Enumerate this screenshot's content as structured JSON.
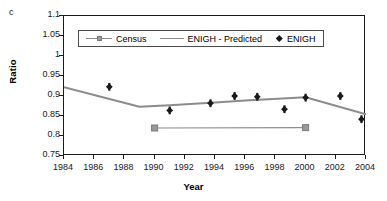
{
  "panel": {
    "letter": "c"
  },
  "chart_data": {
    "type": "line",
    "title": "",
    "xlabel": "Year",
    "ylabel": "Ratio",
    "xlim": [
      1984,
      2004
    ],
    "ylim": [
      0.75,
      1.1
    ],
    "xticks": [
      1984,
      1986,
      1988,
      1990,
      1992,
      1994,
      1996,
      1998,
      2000,
      2002,
      2004
    ],
    "yticks": [
      0.75,
      0.8,
      0.85,
      0.9,
      0.95,
      1,
      1.05,
      1.1
    ],
    "ytick_labels": [
      "0.75",
      "0.8",
      "0.85",
      "0.9",
      "0.95",
      "1",
      "1.05",
      "1.1"
    ],
    "grid": false,
    "legend_position": "upper-center",
    "series": [
      {
        "name": "Census",
        "style": "line-marker",
        "marker": "square",
        "color": "#999999",
        "line_color": "#8c8c8c",
        "x": [
          1990,
          2000
        ],
        "values": [
          0.82,
          0.821
        ]
      },
      {
        "name": "ENIGH - Predicted",
        "style": "line",
        "marker": "none",
        "color": "#8c8c8c",
        "line_color": "#8c8c8c",
        "x": [
          1984,
          1989,
          1991,
          1994,
          1996,
          2000,
          2004
        ],
        "values": [
          0.922,
          0.873,
          0.877,
          0.884,
          0.889,
          0.897,
          0.854
        ]
      },
      {
        "name": "ENIGH",
        "style": "marker",
        "marker": "diamond",
        "color": "#1a1a1a",
        "x": [
          1987,
          1991,
          1993.7,
          1995.3,
          1996.8,
          1998.6,
          2000,
          2002.3,
          2003.7
        ],
        "values": [
          0.923,
          0.864,
          0.882,
          0.9,
          0.898,
          0.867,
          0.896,
          0.9,
          0.842
        ]
      }
    ]
  },
  "legend": {
    "items": [
      {
        "label": "Census",
        "swatch": "line-square"
      },
      {
        "label": "ENIGH - Predicted",
        "swatch": "line"
      },
      {
        "label": "ENIGH",
        "swatch": "diamond"
      }
    ]
  }
}
